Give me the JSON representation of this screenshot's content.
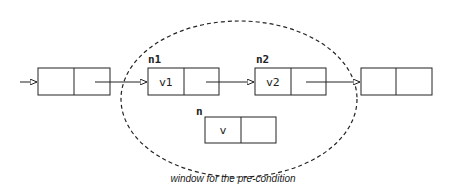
{
  "diagram": {
    "caption": "window for the pre-condition",
    "colors": {
      "stroke": "#222222",
      "background": "#ffffff"
    },
    "window": {
      "shape": "dashed-ellipse",
      "cx": 239,
      "cy": 99,
      "rx": 118,
      "ry": 78
    },
    "nodes": [
      {
        "id": "prev",
        "label": "",
        "value": "",
        "x": 38,
        "y": 68,
        "w": 72,
        "h": 27
      },
      {
        "id": "n1",
        "label": "n1",
        "value": "v1",
        "x": 148,
        "y": 68,
        "w": 71,
        "h": 27
      },
      {
        "id": "n2",
        "label": "n2",
        "value": "v2",
        "x": 255,
        "y": 68,
        "w": 71,
        "h": 27
      },
      {
        "id": "next",
        "label": "",
        "value": "",
        "x": 361,
        "y": 68,
        "w": 71,
        "h": 27
      },
      {
        "id": "n",
        "label": "n",
        "value": "v",
        "x": 205,
        "y": 117,
        "w": 71,
        "h": 26
      }
    ],
    "edges": [
      {
        "from": "external",
        "to": "prev"
      },
      {
        "from": "prev",
        "to": "n1"
      },
      {
        "from": "n1",
        "to": "n2"
      },
      {
        "from": "n2",
        "to": "next"
      }
    ]
  }
}
